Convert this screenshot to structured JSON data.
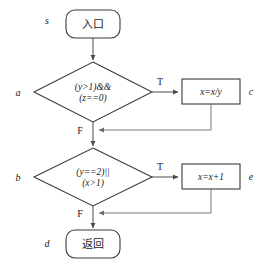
{
  "diagram": {
    "nodes": {
      "entry": {
        "tag": "s",
        "label": "入口",
        "shape": "terminal"
      },
      "decision_a": {
        "tag": "a",
        "line1": "(y>1)&&",
        "line2": "(z==0)",
        "shape": "diamond"
      },
      "process_c": {
        "tag": "c",
        "label": "x=x/y",
        "shape": "rectangle"
      },
      "decision_b": {
        "tag": "b",
        "line1": "(y==2)||",
        "line2": "(x>1)",
        "shape": "diamond"
      },
      "process_e": {
        "tag": "e",
        "label": "x=x+1",
        "shape": "rectangle"
      },
      "exit": {
        "tag": "d",
        "label": "返回",
        "shape": "terminal"
      }
    },
    "branch_labels": {
      "true_a": "T",
      "false_a": "F",
      "true_b": "T",
      "false_b": "F"
    },
    "colors": {
      "stroke": "#3a3a3a",
      "line": "#4a4a4a",
      "loop_line": "#6a6a6a",
      "text": "#1a1a1a",
      "background": "#ffffff"
    }
  }
}
